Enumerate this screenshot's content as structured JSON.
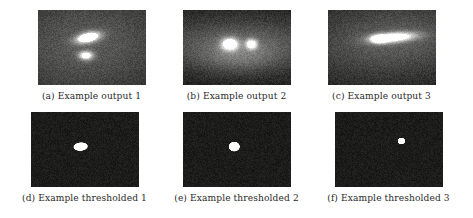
{
  "figure": {
    "background_color": "#ffffff",
    "caption_color": "#2a2a2a",
    "rows": [
      {
        "name": "outputs-row",
        "panels": [
          {
            "label": "(a) Example output 1",
            "image_name": "example-output-1",
            "kind": "grayscale-noise",
            "background_color": "#201f1f",
            "noise_level": 26,
            "blobs": [
              {
                "cx": 0.46,
                "cy": 0.36,
                "rx": 0.115,
                "ry": 0.065,
                "rot": -22,
                "peak": 255,
                "soft": 0.35
              },
              {
                "cx": 0.44,
                "cy": 0.6,
                "rx": 0.045,
                "ry": 0.04,
                "rot": 0,
                "peak": 215,
                "soft": 0.5
              },
              {
                "cx": 0.45,
                "cy": 0.46,
                "rx": 0.3,
                "ry": 0.26,
                "rot": -10,
                "peak": 58,
                "soft": 1.0
              }
            ]
          },
          {
            "label": "(b) Example output 2",
            "image_name": "example-output-2",
            "kind": "grayscale-noise",
            "background_color": "#201f1f",
            "noise_level": 26,
            "blobs": [
              {
                "cx": 0.43,
                "cy": 0.45,
                "rx": 0.075,
                "ry": 0.08,
                "rot": 0,
                "peak": 255,
                "soft": 0.35
              },
              {
                "cx": 0.63,
                "cy": 0.45,
                "rx": 0.04,
                "ry": 0.05,
                "rot": 0,
                "peak": 225,
                "soft": 0.45
              },
              {
                "cx": 0.52,
                "cy": 0.45,
                "rx": 0.28,
                "ry": 0.12,
                "rot": 0,
                "peak": 70,
                "soft": 1.0
              },
              {
                "cx": 0.52,
                "cy": 0.64,
                "rx": 0.13,
                "ry": 0.07,
                "rot": 0,
                "peak": 40,
                "soft": 1.0
              }
            ]
          },
          {
            "label": "(c) Example output 3",
            "image_name": "example-output-3",
            "kind": "grayscale-noise",
            "background_color": "#201f1f",
            "noise_level": 26,
            "blobs": [
              {
                "cx": 0.6,
                "cy": 0.36,
                "rx": 0.175,
                "ry": 0.055,
                "rot": -7,
                "peak": 255,
                "soft": 0.4
              },
              {
                "cx": 0.47,
                "cy": 0.38,
                "rx": 0.06,
                "ry": 0.045,
                "rot": 0,
                "peak": 245,
                "soft": 0.4
              },
              {
                "cx": 0.6,
                "cy": 0.4,
                "rx": 0.3,
                "ry": 0.17,
                "rot": -6,
                "peak": 62,
                "soft": 1.0
              }
            ]
          }
        ]
      },
      {
        "name": "thresholded-row",
        "panels": [
          {
            "label": "(d) Example thresholded 1",
            "image_name": "example-thresholded-1",
            "kind": "thresholded-noise",
            "background_color": "#1c1b1b",
            "noise_level": 18,
            "blobs": [
              {
                "cx": 0.455,
                "cy": 0.455,
                "rx": 0.062,
                "ry": 0.052,
                "rot": -15,
                "peak": 255,
                "soft": 0.07
              }
            ]
          },
          {
            "label": "(e) Example thresholded 2",
            "image_name": "example-thresholded-2",
            "kind": "thresholded-noise",
            "background_color": "#1c1b1b",
            "noise_level": 18,
            "blobs": [
              {
                "cx": 0.47,
                "cy": 0.455,
                "rx": 0.048,
                "ry": 0.06,
                "rot": 0,
                "peak": 255,
                "soft": 0.07
              }
            ]
          },
          {
            "label": "(f) Example thresholded 3",
            "image_name": "example-thresholded-3",
            "kind": "thresholded-noise",
            "background_color": "#1c1b1b",
            "noise_level": 18,
            "blobs": [
              {
                "cx": 0.61,
                "cy": 0.38,
                "rx": 0.032,
                "ry": 0.04,
                "rot": 0,
                "peak": 255,
                "soft": 0.07
              }
            ]
          }
        ]
      }
    ]
  }
}
